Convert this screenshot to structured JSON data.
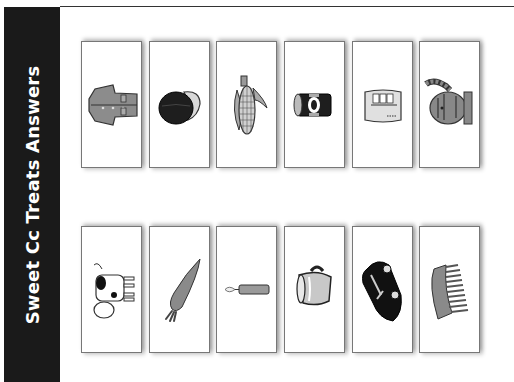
{
  "sidebar": {
    "title": "Sweet Cc Treats Answers"
  },
  "cards": {
    "row1": [
      {
        "label": "coat",
        "icon": "coat-icon"
      },
      {
        "label": "cap",
        "icon": "cap-icon"
      },
      {
        "label": "corn",
        "icon": "corn-icon"
      },
      {
        "label": "can",
        "icon": "can-icon"
      },
      {
        "label": "cup of cocoa",
        "icon": "cocoa-icon"
      },
      {
        "label": "cat",
        "icon": "cat-icon"
      }
    ],
    "row2": [
      {
        "label": "cow",
        "icon": "cow-icon"
      },
      {
        "label": "carrot",
        "icon": "carrot-icon"
      },
      {
        "label": "candle",
        "icon": "candle-icon"
      },
      {
        "label": "cup",
        "icon": "cup-icon"
      },
      {
        "label": "car",
        "icon": "car-icon"
      },
      {
        "label": "comb",
        "icon": "comb-icon"
      }
    ]
  }
}
